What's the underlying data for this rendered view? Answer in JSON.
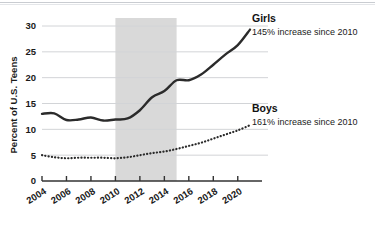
{
  "chart_data": {
    "type": "line",
    "title": "",
    "subtitle": "",
    "xlabel": "",
    "ylabel": "Percent of U.S. Teens",
    "xlim": [
      2004,
      2021
    ],
    "ylim": [
      0,
      30
    ],
    "grid": true,
    "legend_position": "right-inline",
    "yticks": [
      "0",
      "5",
      "10",
      "15",
      "20",
      "25",
      "30"
    ],
    "ytick_values": [
      0,
      5,
      10,
      15,
      20,
      25,
      30
    ],
    "xticks": [
      "2004",
      "2006",
      "2008",
      "2010",
      "2012",
      "2014",
      "2016",
      "2018",
      "2020"
    ],
    "xtick_values": [
      2004,
      2006,
      2008,
      2010,
      2012,
      2014,
      2016,
      2018,
      2020
    ],
    "shaded_band": {
      "x_start": 2010,
      "x_end": 2015,
      "color": "#d9d9d9",
      "label": ""
    },
    "x": [
      2004,
      2005,
      2006,
      2007,
      2008,
      2009,
      2010,
      2011,
      2012,
      2013,
      2014,
      2015,
      2016,
      2017,
      2018,
      2019,
      2020,
      2021
    ],
    "series": [
      {
        "name": "Girls",
        "annotation": "145% increase since 2010",
        "style": "solid",
        "color": "#2b2b2b",
        "values": [
          13.0,
          13.1,
          11.8,
          11.9,
          12.3,
          11.7,
          11.9,
          12.1,
          13.7,
          16.2,
          17.4,
          19.5,
          19.5,
          20.6,
          22.5,
          24.5,
          26.3,
          29.3
        ]
      },
      {
        "name": "Boys",
        "annotation": "161% increase since 2010",
        "style": "dotted",
        "color": "#2b2b2b",
        "values": [
          5.0,
          4.6,
          4.4,
          4.5,
          4.5,
          4.5,
          4.4,
          4.6,
          5.0,
          5.4,
          5.7,
          6.2,
          6.8,
          7.4,
          8.2,
          9.0,
          9.8,
          10.8
        ]
      }
    ]
  },
  "axis": {
    "y_title": "Percent of U.S. Teens"
  }
}
